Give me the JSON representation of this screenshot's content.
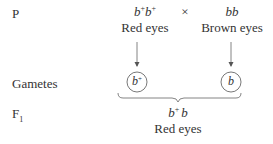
{
  "rows": {
    "parental_label": "P",
    "gametes_label": "Gametes",
    "f1_label": "F",
    "f1_subscript": "1"
  },
  "cross": {
    "symbol": "×",
    "parent1": {
      "allele1": "b",
      "allele1_sup": "+",
      "allele2": "b",
      "allele2_sup": "+",
      "phenotype": "Red eyes"
    },
    "parent2": {
      "genotype": "bb",
      "phenotype": "Brown eyes"
    }
  },
  "gametes": [
    {
      "allele": "b",
      "sup": "+"
    },
    {
      "allele": "b",
      "sup": ""
    }
  ],
  "offspring": {
    "allele1": "b",
    "allele1_sup": "+",
    "allele2": "b",
    "phenotype": "Red eyes"
  },
  "colors": {
    "text": "#333333",
    "lines": "#555555"
  }
}
